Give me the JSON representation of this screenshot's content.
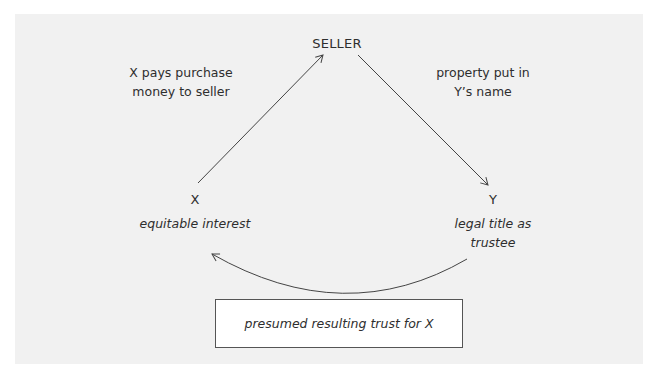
{
  "diagram": {
    "type": "flow",
    "nodes": {
      "seller": {
        "label": "SELLER"
      },
      "x": {
        "label": "X",
        "note": "equitable interest"
      },
      "y": {
        "label": "Y",
        "note_line1": "legal title as",
        "note_line2": "trustee"
      }
    },
    "edges": {
      "x_to_seller": {
        "label_line1": "X pays purchase",
        "label_line2": "money to seller"
      },
      "seller_to_y": {
        "label_line1": "property put in",
        "label_line2": "Y’s name"
      },
      "y_to_x": {
        "label": ""
      }
    },
    "result": {
      "label": "presumed resulting trust for X"
    }
  },
  "colors": {
    "panel_bg": "#f1f1f1",
    "line": "#444444",
    "box_bg": "#ffffff",
    "box_border": "#555555",
    "text": "#2e2e2e"
  }
}
